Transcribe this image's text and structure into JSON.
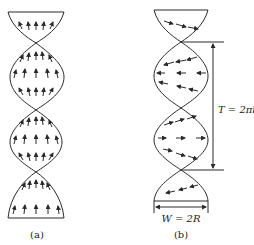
{
  "figure": {
    "panel_a": {
      "caption": "(a)",
      "description": "Double-helix ribbon with arrows pointing upward (along axis)"
    },
    "panel_b": {
      "caption": "(b)",
      "description": "Double-helix ribbon with arrows pointing sideways, rotating with the twist",
      "period_label": "T = 2πb",
      "width_label": "W = 2R"
    },
    "colors": {
      "stroke": "#2a2a2a",
      "background": "#ffffff"
    }
  }
}
